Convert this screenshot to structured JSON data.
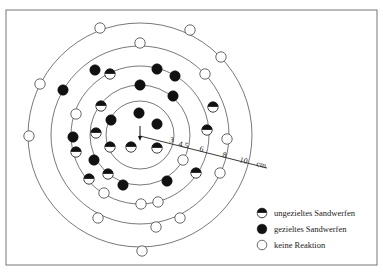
{
  "diagram": {
    "center": {
      "x": 140,
      "y": 135
    },
    "frame": {
      "x": 6,
      "y": 10,
      "width": 371,
      "height": 255
    },
    "rings": [
      {
        "label": "3",
        "r": 34
      },
      {
        "label": "4.5",
        "r": 50
      },
      {
        "label": "6",
        "r": 69
      },
      {
        "label": "8",
        "r": 89
      },
      {
        "label": "10",
        "r": 112
      }
    ],
    "scale": {
      "start": {
        "x": 140,
        "y": 136
      },
      "end": {
        "x": 267,
        "y": 168
      },
      "unit": "cm",
      "tick_labels": [
        {
          "text": "3",
          "x": 169,
          "y": 142
        },
        {
          "text": "4.5",
          "x": 178,
          "y": 146
        },
        {
          "text": "6",
          "x": 199,
          "y": 151
        },
        {
          "text": "8",
          "x": 222,
          "y": 157
        },
        {
          "text": "10",
          "x": 239,
          "y": 162
        },
        {
          "text": "cm",
          "x": 256,
          "y": 166
        }
      ]
    },
    "center_marker": "arrow-down",
    "markers": [
      {
        "type": "open",
        "x": 100,
        "y": 28
      },
      {
        "type": "open",
        "x": 190,
        "y": 30
      },
      {
        "type": "open",
        "x": 140,
        "y": 43
      },
      {
        "type": "open",
        "x": 221,
        "y": 57
      },
      {
        "type": "open",
        "x": 205,
        "y": 74
      },
      {
        "type": "open",
        "x": 40,
        "y": 84
      },
      {
        "type": "open",
        "x": 76,
        "y": 114
      },
      {
        "type": "open",
        "x": 29,
        "y": 136
      },
      {
        "type": "open",
        "x": 227,
        "y": 139
      },
      {
        "type": "open",
        "x": 183,
        "y": 160
      },
      {
        "type": "open",
        "x": 220,
        "y": 173
      },
      {
        "type": "open",
        "x": 104,
        "y": 193
      },
      {
        "type": "open",
        "x": 141,
        "y": 204
      },
      {
        "type": "open",
        "x": 158,
        "y": 202
      },
      {
        "type": "open",
        "x": 98,
        "y": 218
      },
      {
        "type": "open",
        "x": 180,
        "y": 218
      },
      {
        "type": "open",
        "x": 156,
        "y": 227
      },
      {
        "type": "open",
        "x": 142,
        "y": 251
      },
      {
        "type": "filled",
        "x": 95,
        "y": 70
      },
      {
        "type": "filled",
        "x": 157,
        "y": 69
      },
      {
        "type": "filled",
        "x": 175,
        "y": 76
      },
      {
        "type": "filled",
        "x": 140,
        "y": 85
      },
      {
        "type": "filled",
        "x": 63,
        "y": 90
      },
      {
        "type": "filled",
        "x": 173,
        "y": 96
      },
      {
        "type": "filled",
        "x": 139,
        "y": 113
      },
      {
        "type": "filled",
        "x": 111,
        "y": 120
      },
      {
        "type": "filled",
        "x": 157,
        "y": 124
      },
      {
        "type": "filled",
        "x": 73,
        "y": 137
      },
      {
        "type": "filled",
        "x": 94,
        "y": 160
      },
      {
        "type": "filled",
        "x": 123,
        "y": 185
      },
      {
        "type": "filled",
        "x": 167,
        "y": 181
      },
      {
        "type": "half",
        "x": 110,
        "y": 74
      },
      {
        "type": "half",
        "x": 101,
        "y": 106
      },
      {
        "type": "half",
        "x": 213,
        "y": 107
      },
      {
        "type": "half",
        "x": 96,
        "y": 133
      },
      {
        "type": "half",
        "x": 207,
        "y": 130
      },
      {
        "type": "half",
        "x": 110,
        "y": 147
      },
      {
        "type": "half",
        "x": 131,
        "y": 147
      },
      {
        "type": "half",
        "x": 157,
        "y": 148
      },
      {
        "type": "half",
        "x": 76,
        "y": 152
      },
      {
        "type": "half",
        "x": 108,
        "y": 174
      },
      {
        "type": "half",
        "x": 89,
        "y": 179
      },
      {
        "type": "half",
        "x": 196,
        "y": 173
      }
    ],
    "marker_radius": 5.2
  },
  "legend": {
    "items": [
      {
        "type": "half",
        "label": "ungezieltes Sandwerfen",
        "x": 262,
        "y": 213
      },
      {
        "type": "filled",
        "label": "gezieltes Sandwerfen",
        "x": 262,
        "y": 229
      },
      {
        "type": "open",
        "label": "keine Reaktion",
        "x": 262,
        "y": 245
      }
    ],
    "text_x": 274
  },
  "colors": {
    "ink": "#111111",
    "ring": "#555555",
    "frame": "#777777",
    "background": "#ffffff"
  }
}
